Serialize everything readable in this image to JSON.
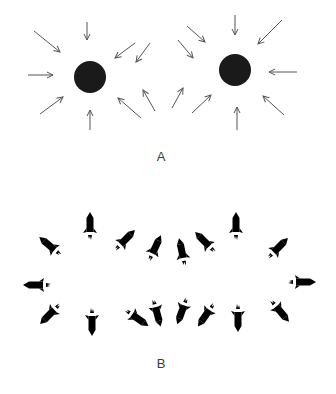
{
  "figure": {
    "panels": [
      {
        "label": "A",
        "label_pos": [
          161,
          157
        ],
        "description": "Two black spheres with arrows pointing inward from all directions",
        "circles": [
          {
            "cx": 90,
            "cy": 77,
            "r": 16,
            "color": "#1a1a1a"
          },
          {
            "cx": 235,
            "cy": 70,
            "r": 16,
            "color": "#1a1a1a"
          }
        ],
        "arrows": [
          {
            "from": [
              34,
              31
            ],
            "to": [
              60,
              52
            ]
          },
          {
            "from": [
              87,
              22
            ],
            "to": [
              87,
              40
            ]
          },
          {
            "from": [
              135,
              43
            ],
            "to": [
              115,
              58
            ]
          },
          {
            "from": [
              150,
              43
            ],
            "to": [
              136,
              62
            ]
          },
          {
            "from": [
              28,
              75
            ],
            "to": [
              53,
              75
            ]
          },
          {
            "from": [
              40,
              114
            ],
            "to": [
              63,
              97
            ]
          },
          {
            "from": [
              90,
              130
            ],
            "to": [
              90,
              110
            ]
          },
          {
            "from": [
              141,
              118
            ],
            "to": [
              118,
              98
            ]
          },
          {
            "from": [
              155,
              111
            ],
            "to": [
              143,
              90
            ]
          },
          {
            "from": [
              187,
              26
            ],
            "to": [
              205,
              42
            ]
          },
          {
            "from": [
              178,
              40
            ],
            "to": [
              193,
              58
            ]
          },
          {
            "from": [
              235,
              15
            ],
            "to": [
              235,
              35
            ]
          },
          {
            "from": [
              282,
              20
            ],
            "to": [
              258,
              44
            ]
          },
          {
            "from": [
              297,
              72
            ],
            "to": [
              269,
              72
            ]
          },
          {
            "from": [
              284,
              115
            ],
            "to": [
              263,
              96
            ]
          },
          {
            "from": [
              237,
              130
            ],
            "to": [
              237,
              107
            ]
          },
          {
            "from": [
              192,
              113
            ],
            "to": [
              211,
              95
            ]
          },
          {
            "from": [
              172,
              108
            ],
            "to": [
              183,
              88
            ]
          }
        ]
      },
      {
        "label": "B",
        "label_pos": [
          161,
          364
        ],
        "description": "Rockets firing in various directions, arranged around two empty centers",
        "rockets": [
          {
            "x": 90,
            "y": 226,
            "angle": 0
          },
          {
            "x": 50,
            "y": 246,
            "angle": -50
          },
          {
            "x": 125,
            "y": 240,
            "angle": 45
          },
          {
            "x": 155,
            "y": 248,
            "angle": 25
          },
          {
            "x": 182,
            "y": 252,
            "angle": -12
          },
          {
            "x": 205,
            "y": 242,
            "angle": -45
          },
          {
            "x": 236,
            "y": 226,
            "angle": 0
          },
          {
            "x": 278,
            "y": 248,
            "angle": 45
          },
          {
            "x": 37,
            "y": 285,
            "angle": -90
          },
          {
            "x": 302,
            "y": 282,
            "angle": 90
          },
          {
            "x": 50,
            "y": 314,
            "angle": -135
          },
          {
            "x": 92,
            "y": 322,
            "angle": 180
          },
          {
            "x": 137,
            "y": 318,
            "angle": 125
          },
          {
            "x": 157,
            "y": 313,
            "angle": 165
          },
          {
            "x": 182,
            "y": 311,
            "angle": -160
          },
          {
            "x": 206,
            "y": 315,
            "angle": -145
          },
          {
            "x": 238,
            "y": 318,
            "angle": 180
          },
          {
            "x": 280,
            "y": 311,
            "angle": 140
          }
        ]
      }
    ],
    "colors": {
      "ink": "#222222",
      "arrow": "#555555",
      "sphere": "#1a1a1a",
      "background": "#ffffff"
    }
  }
}
